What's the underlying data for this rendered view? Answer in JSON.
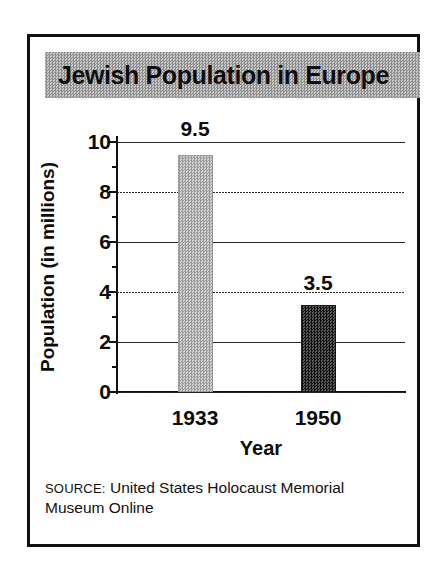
{
  "figure": {
    "title": "Jewish Population in Europe",
    "source_keyword": "SOURCE:",
    "source_text": "United States Holocaust Memorial Museum Online",
    "colors": {
      "title_band": "#a8a8a8",
      "bar_1933": "#b6b6b6",
      "bar_1950": "#333333",
      "frame": "#111111",
      "text": "#0c0c0c"
    }
  },
  "chart_data": {
    "type": "bar",
    "title": "Jewish Population in Europe",
    "xlabel": "Year",
    "ylabel": "Population (in millions)",
    "categories": [
      "1933",
      "1950"
    ],
    "values": [
      9.5,
      3.5
    ],
    "data_labels": [
      "9.5",
      "3.5"
    ],
    "bar_colors": [
      "#b6b6b6",
      "#333333"
    ],
    "ylim": [
      0,
      10
    ],
    "ytick_labels": [
      "0",
      "2",
      "4",
      "6",
      "8",
      "10"
    ],
    "ytick_values": [
      0,
      2,
      4,
      6,
      8,
      10
    ],
    "grid": true,
    "grid_axis": "y",
    "legend": false
  }
}
